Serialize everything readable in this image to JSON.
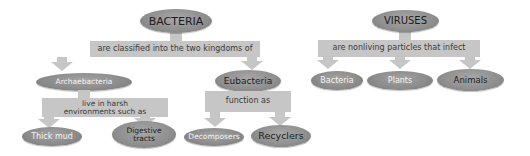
{
  "colors": {
    "oval_fill": "#8e8e8e",
    "connector_fill": "#c6c6c6",
    "background": "#ffffff"
  },
  "bacteria": {
    "root": "BACTERIA",
    "link": "are classified into the two kingdoms of",
    "kingdoms": [
      {
        "label": "Archaebacteria",
        "link": "live in harsh environments such as",
        "children": [
          "Thick mud",
          "Digestive tracts"
        ]
      },
      {
        "label": "Eubacteria",
        "link": "function as",
        "children": [
          "Decomposers",
          "Recyclers"
        ]
      }
    ]
  },
  "viruses": {
    "root": "VIRUSES",
    "link": "are nonliving particles that infect",
    "targets": [
      "Bacteria",
      "Plants",
      "Animals"
    ]
  }
}
